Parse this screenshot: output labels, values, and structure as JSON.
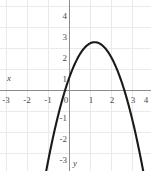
{
  "chart_data": {
    "type": "line",
    "title": "",
    "subtitle": "",
    "xlabel": "x",
    "ylabel": "y",
    "xlim": [
      -3.5,
      4.4
    ],
    "ylim": [
      -3.6,
      4.5
    ],
    "grid": true,
    "legend": false,
    "legend_position": "none",
    "xticks": [
      -3,
      -2,
      -1,
      0,
      1,
      2,
      3,
      4
    ],
    "yticks": [
      4,
      3,
      2,
      1,
      0,
      -1,
      -2,
      -3
    ],
    "xtick_labels": [
      "-3",
      "-2",
      "-1",
      "0",
      "1",
      "2",
      "3",
      "4"
    ],
    "ytick_labels": [
      "4",
      "3",
      "2",
      "1",
      "0",
      "-1",
      "-2",
      "-3"
    ],
    "annotations": [],
    "series": [
      {
        "name": "parabola",
        "kind": "parabola-downward",
        "color": "#1a1a1a",
        "linewidth": 2.1,
        "vertex": [
          1.2,
          2.3
        ],
        "roots": [
          -0.28,
          2.68
        ],
        "y_intercept": 1.0,
        "leading_coefficient": -1.15,
        "equation": "y = -1.15(x - 1.2)^2 + 2.3",
        "x": [
          -0.95,
          -0.8,
          -0.6,
          -0.4,
          -0.28,
          0,
          0.3,
          0.6,
          0.9,
          1.2,
          1.5,
          1.8,
          2.1,
          2.4,
          2.68,
          3,
          3.3,
          3.6,
          3.85
        ],
        "y": [
          -2.66,
          -2.3,
          -1.42,
          -1.38,
          0,
          1.0,
          1.37,
          1.89,
          2.2,
          2.3,
          2.2,
          1.89,
          1.37,
          0.63,
          0,
          -1.06,
          -2.2,
          -3.5,
          -4.0
        ]
      }
    ]
  },
  "axis_labels": {
    "x": "x",
    "y": "y"
  },
  "colors": {
    "grid": "#e8eaec",
    "axis": "#8c8c8c",
    "curve": "#1a1a1a",
    "tick_text": "#4a4a4a",
    "background": "#ffffff"
  }
}
